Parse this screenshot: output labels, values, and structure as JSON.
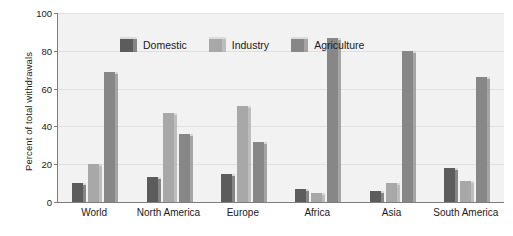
{
  "chart_data": {
    "type": "bar",
    "title": "",
    "subtitle": "",
    "xlabel": "",
    "ylabel": "Percent of total withdrawals",
    "ylim": [
      0,
      100
    ],
    "yticks": [
      0,
      20,
      40,
      60,
      80,
      100
    ],
    "grid": true,
    "legend_position": "top-left inside plot",
    "categories": [
      "World",
      "North America",
      "Europe",
      "Africa",
      "Asia",
      "South America"
    ],
    "series": [
      {
        "name": "Domestic",
        "color": "#5c5c5c",
        "values": [
          10,
          13,
          15,
          7,
          6,
          18
        ]
      },
      {
        "name": "Industry",
        "color": "#a8a8a8",
        "values": [
          20,
          47,
          51,
          5,
          10,
          11
        ]
      },
      {
        "name": "Agriculture",
        "color": "#878787",
        "values": [
          69,
          36,
          32,
          87,
          80,
          66
        ]
      }
    ]
  },
  "axes": {
    "y_title": "Percent of total withdrawals",
    "y_tick_labels": [
      "100",
      "80",
      "60",
      "40",
      "20",
      "0"
    ],
    "x_tick_labels": [
      "World",
      "North America",
      "Europe",
      "Africa",
      "Asia",
      "South America"
    ]
  },
  "legend": {
    "items": [
      {
        "label": "Domestic"
      },
      {
        "label": "Industry"
      },
      {
        "label": "Agriculture"
      }
    ]
  },
  "colors": {
    "domestic": "#5c5c5c",
    "industry": "#a8a8a8",
    "agriculture": "#878787",
    "plot_background": "#f2f2f2",
    "gridline": "#e0e0e0",
    "axis": "#7d7d7d"
  }
}
